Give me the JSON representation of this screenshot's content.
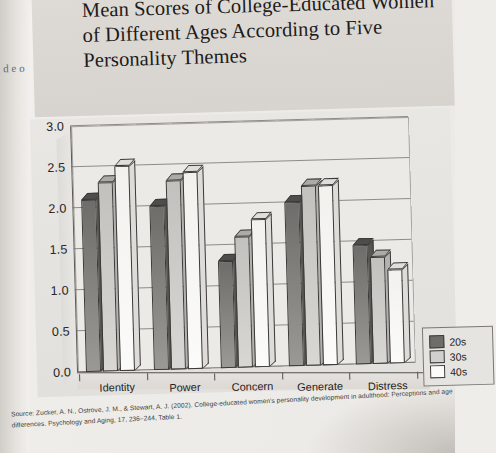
{
  "figure": {
    "number": "FIGURE 10.1",
    "title": "Mean Scores of College-Educated Women of Different Ages According to Five Personality Themes"
  },
  "margin_fragments": "d e o",
  "legend": {
    "title": "",
    "entries": [
      {
        "label": "20s",
        "color": "#6f6d6a"
      },
      {
        "label": "30s",
        "color": "#d2d0cc"
      },
      {
        "label": "40s",
        "color": "#fbfbf9"
      }
    ]
  },
  "source_note": "Source: Zucker, A. N., Ostrove, J. M., & Stewart, A. J. (2002). College-educated women's personality development in adulthood: Perceptions and age differences. Psychology and Aging, 17, 236–244, Table 1.",
  "chart_data": {
    "type": "bar",
    "title": "Mean Scores of College-Educated Women of Different Ages According to Five Personality Themes",
    "xlabel": "",
    "ylabel": "",
    "ylim": [
      0.0,
      3.0
    ],
    "ytick_labels": [
      "0.0",
      "0.5",
      "1.0",
      "1.5",
      "2.0",
      "2.5",
      "3.0"
    ],
    "ytick_values": [
      0.0,
      0.5,
      1.0,
      1.5,
      2.0,
      2.5,
      3.0
    ],
    "grid": true,
    "legend_position": "right",
    "three_d": true,
    "categories": [
      "Identity",
      "Power",
      "Concern",
      "Generate",
      "Distress"
    ],
    "series": [
      {
        "name": "20s",
        "color": "#6f6d6a",
        "values": [
          2.1,
          2.0,
          1.3,
          2.0,
          1.45
        ]
      },
      {
        "name": "30s",
        "color": "#d2d0cc",
        "values": [
          2.3,
          2.3,
          1.6,
          2.2,
          1.3
        ]
      },
      {
        "name": "40s",
        "color": "#fbfbf9",
        "values": [
          2.5,
          2.4,
          1.8,
          2.2,
          1.15
        ]
      }
    ]
  }
}
